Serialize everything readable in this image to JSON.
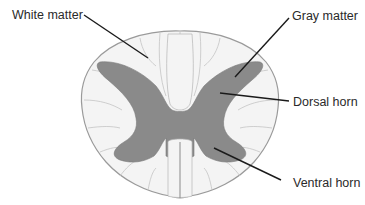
{
  "diagram": {
    "labels": {
      "white_matter": "White matter",
      "gray_matter": "Gray matter",
      "dorsal_horn": "Dorsal horn",
      "ventral_horn": "Ventral horn"
    },
    "colors": {
      "background": "#ffffff",
      "white_matter_fill": "#f4f4f4",
      "white_matter_outline": "#9a9a9a",
      "gray_matter_fill": "#8a8a8a",
      "leader_line": "#1a1a1a",
      "label_text": "#2a2a2a"
    }
  }
}
